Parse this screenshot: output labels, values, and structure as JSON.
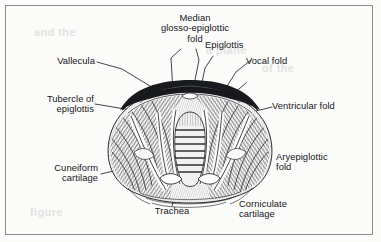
{
  "figure": {
    "frame_color": "#8d8d8d",
    "ink_color": "#15161a",
    "paper_color": "#fbfbfa"
  },
  "labels": [
    {
      "id": "median-glosso-epiglottic-fold",
      "text": "Median\nglosso-epiglottic\nfold",
      "align": "center"
    },
    {
      "id": "epiglottis",
      "text": "Epiglottis",
      "align": "left"
    },
    {
      "id": "vocal-fold",
      "text": "Vocal fold",
      "align": "left"
    },
    {
      "id": "vallecula",
      "text": "Vallecula",
      "align": "right"
    },
    {
      "id": "ventricular-fold",
      "text": "Ventricular fold",
      "align": "left"
    },
    {
      "id": "tubercle-of-epiglottis",
      "text": "Tubercle of\nepiglottis",
      "align": "right"
    },
    {
      "id": "aryepiglottic-fold",
      "text": "Aryepiglottic\nfold",
      "align": "left"
    },
    {
      "id": "cuneiform-cartilage",
      "text": "Cuneiform\ncartilage",
      "align": "right"
    },
    {
      "id": "trachea",
      "text": "Trachea",
      "align": "center"
    },
    {
      "id": "corniculate-cartilage",
      "text": "Corniculate\ncartilage",
      "align": "left"
    }
  ],
  "bleed_text": {
    "line1": "and the",
    "line2": "a plane",
    "line3": "of the",
    "line4": "figure"
  }
}
